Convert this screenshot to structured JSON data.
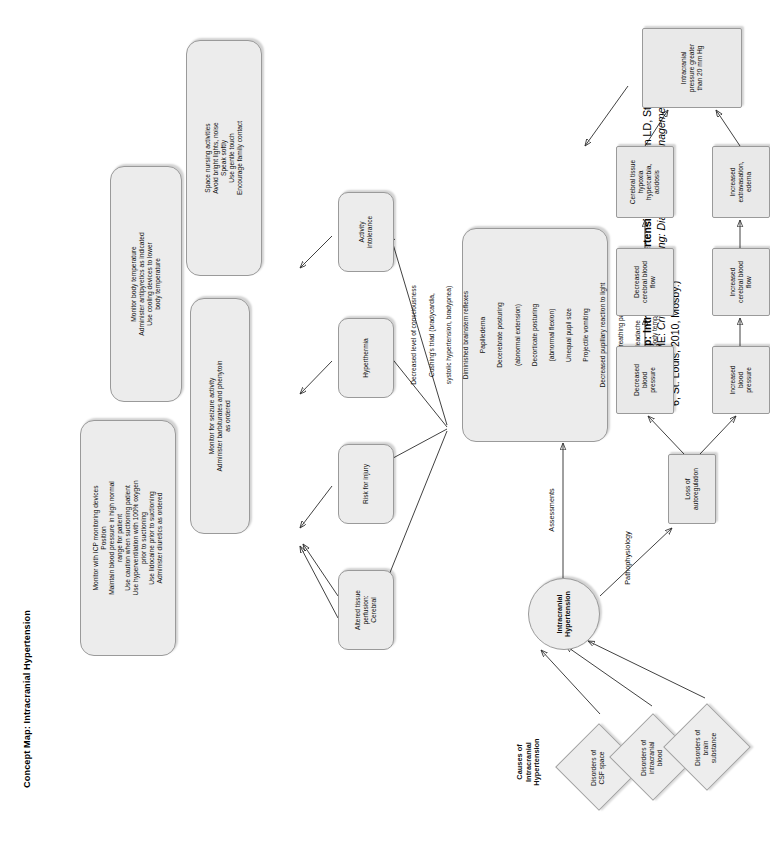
{
  "figure": {
    "title": "Concept Map: Intracranial Hypertension",
    "caption_bold": "Concept Map: Intracranial Hypertension.",
    "caption_rest_1": " (From Urden LD, Stacy KM, Lough ME: ",
    "caption_italic": "Critical care nursing: Diagnosis and management",
    "caption_rest_2": ", ed 6, St. Louis, 2010, Mosby.)"
  },
  "labels": {
    "causes": "Causes of\nIntracranial\nHypertension",
    "assessments": "Assessments",
    "pathophysiology": "Pathophysiology"
  },
  "central_node": {
    "text": "Intracranial\nHypertension"
  },
  "causes": [
    {
      "text": "Disorders of\nCSF space"
    },
    {
      "text": "Disorders of\nintracranial\nblood"
    },
    {
      "text": "Disorders of\nbrain\nsubstance"
    }
  ],
  "assessment_findings": {
    "items": [
      "Decreased level of consciousness",
      "Cushing's triad (bradycardia,",
      "systolic hypertension, bradypnea)",
      "Diminished brainstem reflexes",
      "Papilledema",
      "Decerebrate posturing",
      "(abnormal extension)",
      "Decorticate posturing",
      "(abnormal flexion)",
      "Unequal pupil size",
      "Projectile vomiting",
      "Decreased pupillary reaction to light",
      "Altered breathing patterns",
      "Headache",
      "Elevated body temperature"
    ]
  },
  "nursing_diagnoses": [
    {
      "text": "Altered tissue\nperfusion:\nCerebral"
    },
    {
      "text": "Risk for injury"
    },
    {
      "text": "Hyperthermia"
    },
    {
      "text": "Activity\nintolerance"
    }
  ],
  "interventions": [
    {
      "text": "Monitor with ICP monitoring devices\nPosition\nMaintain blood pressure in high normal\nrange for patient\nUse caution when suctioning patient\nUse hyperventilation with 100% oxygen\nprior to suctioning\nUse lidocaine prior to suctioning\nAdminister diuretics as ordered"
    },
    {
      "text": "Monitor for seizure activity\nAdminister barbiturates and phenytoin\nas ordered"
    },
    {
      "text": "Monitor body temperature\nAdminister antipyretics as indicated\nUse cooling devices to lower\nbody temperature"
    },
    {
      "text": "Space nursing activities\nAvoid bright lights, noise\nSpeak softly\nUse gentle touch\nEncourage family contact"
    }
  ],
  "pathophysiology_chain": {
    "root": {
      "text": "Loss of\nautoregulation"
    },
    "upper_branch": [
      {
        "text": "Decreased\nblood\npressure"
      },
      {
        "text": "Decreased\ncerebral blood\nflow"
      },
      {
        "text": "Cerebral tissue\nhypoxia\nhypercarbia,\nacidosis"
      }
    ],
    "lower_branch": [
      {
        "text": "Increased\nblood\npressure"
      },
      {
        "text": "Increased\ncerebral blood\nflow"
      },
      {
        "text": "Increased\nextravasation,\nedema"
      }
    ],
    "outcome": {
      "text": "Intracranial\npressure greater\nthan 20 mm Hg"
    }
  },
  "colors": {
    "box_fill": "#ececec",
    "box_stroke": "#9a9a9a",
    "edge": "#2b2b2b",
    "text": "#111111"
  }
}
